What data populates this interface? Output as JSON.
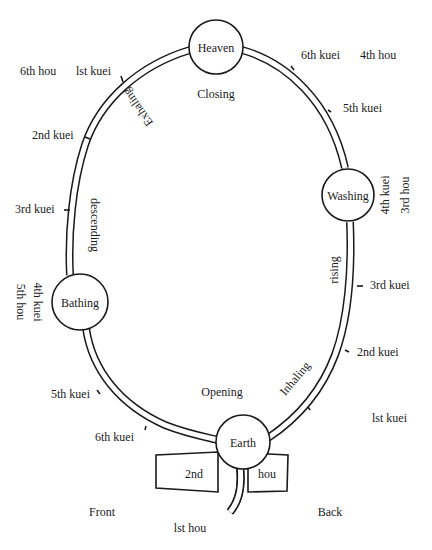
{
  "diagram": {
    "type": "circulation-loop",
    "nodes": {
      "heaven": "Heaven",
      "washing": "Washing",
      "bathing": "Bathing",
      "earth": "Earth"
    },
    "phases": {
      "closing": "Closing",
      "opening": "Opening",
      "exhaling": "Exhaling",
      "descending": "descending",
      "inhaling": "Inhaling",
      "rising": "rising"
    },
    "left_side_ticks": {
      "first_kuei": "lst kuei",
      "second_kuei": "2nd kuei",
      "third_kuei": "3rd kuei",
      "fourth_kuei": "4th kuei",
      "fifth_kuei": "5th kuei",
      "sixth_kuei": "6th kuei"
    },
    "right_side_ticks": {
      "first_kuei": "lst kuei",
      "second_kuei": "2nd kuei",
      "third_kuei": "3rd kuei",
      "fourth_kuei": "4th kuei",
      "fifth_kuei": "5th kuei",
      "sixth_kuei": "6th kuei"
    },
    "hou": {
      "first": "lst hou",
      "second_left": "2nd",
      "second_right": "hou",
      "third": "3rd hou",
      "fourth": "4th hou",
      "fifth": "5th hou",
      "sixth": "6th hou"
    },
    "orientation": {
      "front": "Front",
      "back": "Back"
    }
  }
}
